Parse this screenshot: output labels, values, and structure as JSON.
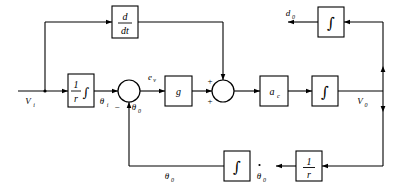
{
  "diagram": {
    "type": "control-block-diagram",
    "signals": {
      "input_vi": "V",
      "input_vi_sub": "i",
      "theta_i": "θ",
      "theta_i_sub": "i",
      "theta_0_feedback": "θ",
      "theta_0_feedback_sub": "0",
      "error_ev": "e",
      "error_ev_sub": "v",
      "output_v0": "V",
      "output_v0_sub": "0",
      "disturbance_d0": "d",
      "disturbance_d0_sub": "0",
      "theta_0_bottom": "θ",
      "theta_0_bottom_sub": "0",
      "theta_dot_0": "θ",
      "theta_dot_0_sub": "0"
    },
    "blocks": {
      "derivative": {
        "numerator": "d",
        "denominator": "dt"
      },
      "input_scaler": {
        "numerator": "1",
        "denominator": "r",
        "operator": "∫"
      },
      "gain": {
        "label": "g"
      },
      "accel": {
        "label": "a",
        "sub": "c"
      },
      "integrator_forward": {
        "operator": "∫"
      },
      "integrator_top": {
        "operator": "∫"
      },
      "integrator_feedback": {
        "operator": "∫"
      },
      "rate_scaler": {
        "numerator": "1",
        "denominator": "r"
      }
    },
    "summing_signs": {
      "junction1_minus": "−",
      "junction2_plus_top": "+",
      "junction2_plus_bottom": "+"
    },
    "colors": {
      "line": "#000000",
      "background": "#ffffff",
      "block_fill": "#ffffff"
    }
  }
}
